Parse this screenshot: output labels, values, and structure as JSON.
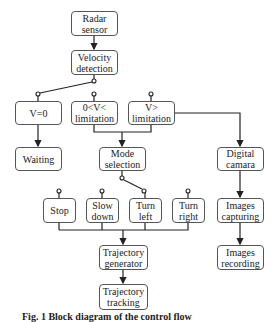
{
  "diagram": {
    "nodes": {
      "radar_sensor": "Radar\nsensor",
      "velocity_detection": "Velocity\ndetection",
      "v_zero": "V=0",
      "v_between": "0<V<\nlimitation",
      "v_above": "V>\nlimitation",
      "waiting": "Waiting",
      "mode_selection": "Mode\nselection",
      "digital_camera": "Digital\ncamara",
      "stop": "Stop",
      "slow_down": "Slow\ndown",
      "turn_left": "Turn\nleft",
      "turn_right": "Turn\nright",
      "images_capturing": "Images\ncapturing",
      "trajectory_generator": "Trajectory\ngenerator",
      "images_recording": "Images\nrecording",
      "trajectory_tracking": "Trajectory\ntracking"
    },
    "edges": [
      [
        "radar_sensor",
        "velocity_detection"
      ],
      [
        "velocity_detection",
        "v_zero",
        "switch"
      ],
      [
        "v_zero",
        "waiting"
      ],
      [
        "v_between",
        "mode_selection"
      ],
      [
        "v_above",
        "mode_selection"
      ],
      [
        "v_above",
        "digital_camera"
      ],
      [
        "mode_selection",
        "turn_left",
        "switch"
      ],
      [
        "stop",
        "trajectory_generator"
      ],
      [
        "slow_down",
        "trajectory_generator"
      ],
      [
        "turn_left",
        "trajectory_generator"
      ],
      [
        "turn_right",
        "trajectory_generator"
      ],
      [
        "trajectory_generator",
        "trajectory_tracking"
      ],
      [
        "digital_camera",
        "images_capturing"
      ],
      [
        "images_capturing",
        "images_recording"
      ]
    ],
    "caption": "Fig. 1 Block diagram of the control flow",
    "colors": {
      "line": "#222222",
      "box_border": "#555555",
      "background": "#ffffff"
    }
  }
}
